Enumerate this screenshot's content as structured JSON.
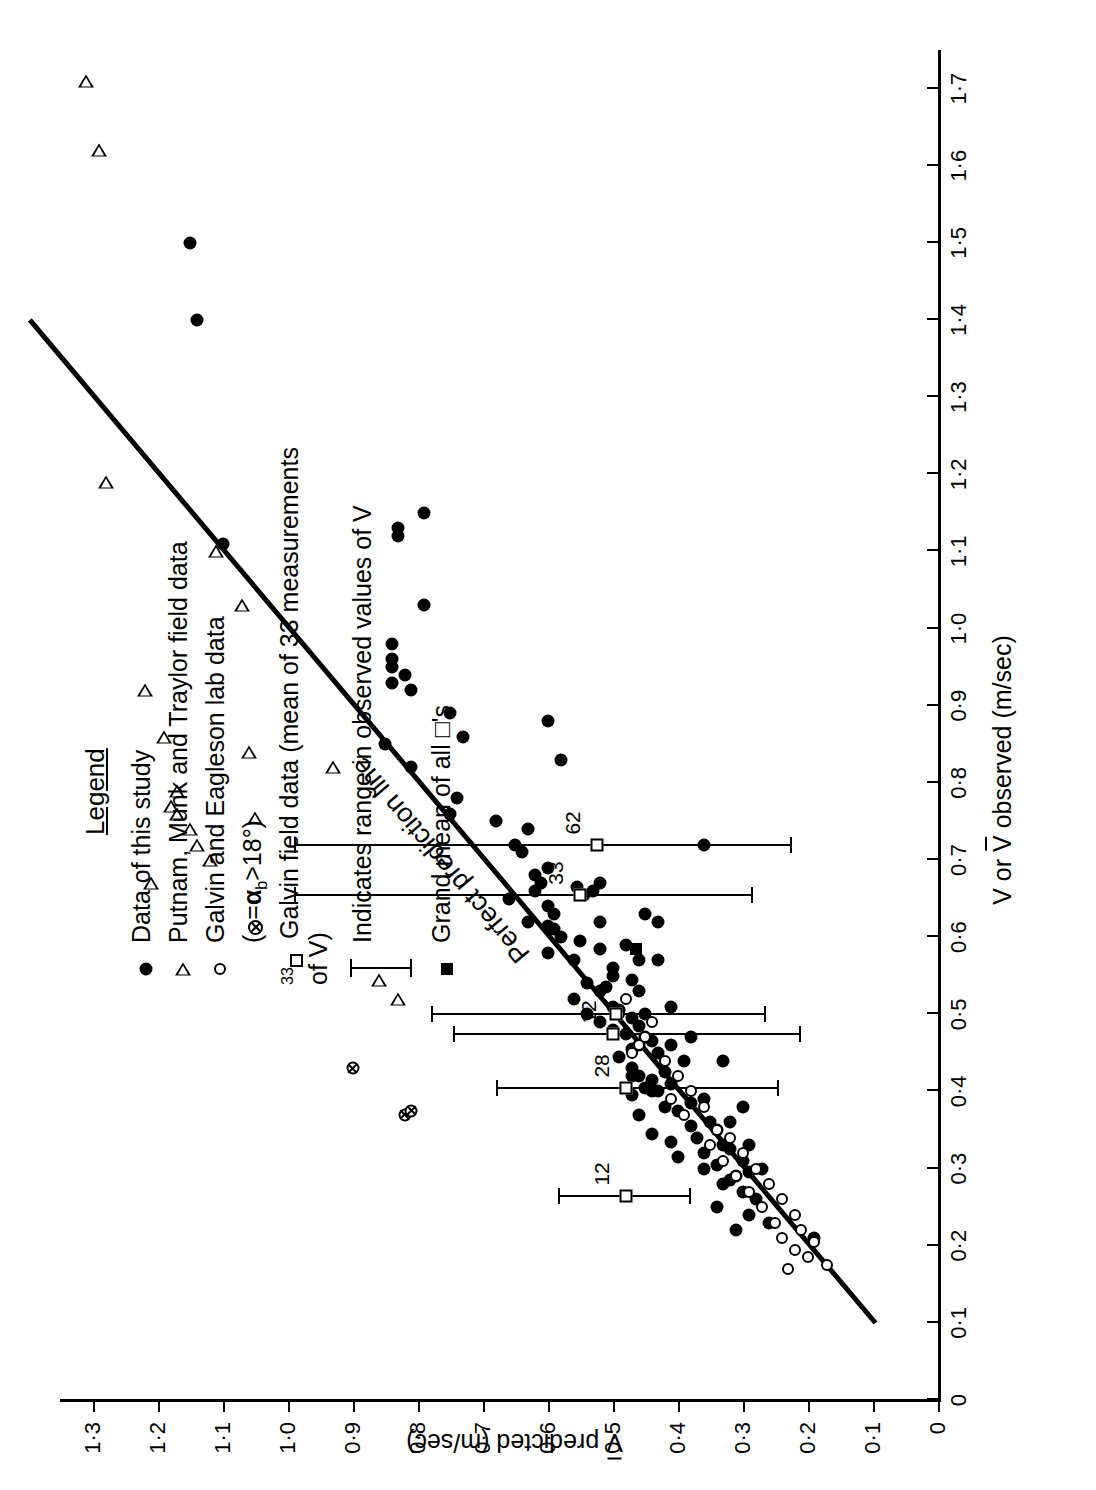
{
  "chart_data": {
    "type": "scatter",
    "title": "",
    "xlabel": "V or V̅ observed (m/sec)",
    "ylabel": "V̅ predicted (m/sec)",
    "xlim": [
      0,
      1.75
    ],
    "ylim": [
      0,
      1.35
    ],
    "xticks": [
      "0",
      "0·1",
      "0·2",
      "0·3",
      "0·4",
      "0·5",
      "0·6",
      "0·7",
      "0·8",
      "0·9",
      "1·0",
      "1·1",
      "1·2",
      "1·3",
      "1·4",
      "1·5",
      "1·6",
      "1·7"
    ],
    "xtickvalues": [
      0,
      0.1,
      0.2,
      0.3,
      0.4,
      0.5,
      0.6,
      0.7,
      0.8,
      0.9,
      1.0,
      1.1,
      1.2,
      1.3,
      1.4,
      1.5,
      1.6,
      1.7
    ],
    "yticks": [
      "0",
      "0·1",
      "0·2",
      "0·3",
      "0·4",
      "0·5",
      "0·6",
      "0·7",
      "0·8",
      "0·9",
      "1·0",
      "1·1",
      "1·2",
      "1·3"
    ],
    "ytickvalues": [
      0,
      0.1,
      0.2,
      0.3,
      0.4,
      0.5,
      0.6,
      0.7,
      0.8,
      0.9,
      1.0,
      1.1,
      1.2,
      1.3
    ],
    "grid": false,
    "legend_position": "top-right",
    "reference_line": {
      "label": "Perfect prediction line",
      "from": [
        0.1,
        0.1
      ],
      "to": [
        1.4,
        1.4
      ]
    },
    "series": [
      {
        "name": "Data of this study",
        "marker": "filled-circle",
        "points": [
          [
            1.5,
            1.15
          ],
          [
            1.4,
            1.14
          ],
          [
            1.11,
            1.1
          ],
          [
            1.15,
            0.79
          ],
          [
            1.13,
            0.83
          ],
          [
            1.12,
            0.83
          ],
          [
            1.03,
            0.79
          ],
          [
            0.98,
            0.84
          ],
          [
            0.96,
            0.84
          ],
          [
            0.95,
            0.84
          ],
          [
            0.93,
            0.84
          ],
          [
            0.94,
            0.82
          ],
          [
            0.92,
            0.81
          ],
          [
            0.89,
            0.75
          ],
          [
            0.86,
            0.73
          ],
          [
            0.85,
            0.85
          ],
          [
            0.82,
            0.81
          ],
          [
            0.78,
            0.74
          ],
          [
            0.76,
            0.75
          ],
          [
            0.75,
            0.68
          ],
          [
            0.74,
            0.63
          ],
          [
            0.72,
            0.65
          ],
          [
            0.71,
            0.64
          ],
          [
            0.69,
            0.6
          ],
          [
            0.68,
            0.62
          ],
          [
            0.67,
            0.61
          ],
          [
            0.66,
            0.62
          ],
          [
            0.665,
            0.555
          ],
          [
            0.655,
            0.545
          ],
          [
            0.66,
            0.53
          ],
          [
            0.65,
            0.66
          ],
          [
            0.64,
            0.6
          ],
          [
            0.63,
            0.59
          ],
          [
            0.62,
            0.63
          ],
          [
            0.615,
            0.6
          ],
          [
            0.61,
            0.59
          ],
          [
            0.6,
            0.58
          ],
          [
            0.595,
            0.55
          ],
          [
            0.585,
            0.52
          ],
          [
            0.58,
            0.6
          ],
          [
            0.57,
            0.56
          ],
          [
            0.56,
            0.5
          ],
          [
            0.55,
            0.5
          ],
          [
            0.545,
            0.47
          ],
          [
            0.54,
            0.54
          ],
          [
            0.535,
            0.51
          ],
          [
            0.53,
            0.52
          ],
          [
            0.52,
            0.56
          ],
          [
            0.51,
            0.5
          ],
          [
            0.505,
            0.49
          ],
          [
            0.5,
            0.45
          ],
          [
            0.495,
            0.47
          ],
          [
            0.49,
            0.52
          ],
          [
            0.485,
            0.46
          ],
          [
            0.48,
            0.5
          ],
          [
            0.475,
            0.48
          ],
          [
            0.47,
            0.45
          ],
          [
            0.465,
            0.44
          ],
          [
            0.46,
            0.46
          ],
          [
            0.455,
            0.47
          ],
          [
            0.45,
            0.43
          ],
          [
            0.445,
            0.49
          ],
          [
            0.44,
            0.39
          ],
          [
            0.43,
            0.47
          ],
          [
            0.425,
            0.42
          ],
          [
            0.42,
            0.46
          ],
          [
            0.415,
            0.44
          ],
          [
            0.41,
            0.41
          ],
          [
            0.405,
            0.45
          ],
          [
            0.4,
            0.43
          ],
          [
            0.395,
            0.47
          ],
          [
            0.39,
            0.36
          ],
          [
            0.385,
            0.38
          ],
          [
            0.38,
            0.42
          ],
          [
            0.375,
            0.4
          ],
          [
            0.37,
            0.46
          ],
          [
            0.36,
            0.35
          ],
          [
            0.355,
            0.38
          ],
          [
            0.35,
            0.34
          ],
          [
            0.345,
            0.44
          ],
          [
            0.34,
            0.37
          ],
          [
            0.335,
            0.41
          ],
          [
            0.33,
            0.33
          ],
          [
            0.325,
            0.32
          ],
          [
            0.32,
            0.36
          ],
          [
            0.315,
            0.4
          ],
          [
            0.31,
            0.3
          ],
          [
            0.305,
            0.34
          ],
          [
            0.3,
            0.36
          ],
          [
            0.295,
            0.29
          ],
          [
            0.29,
            0.31
          ],
          [
            0.285,
            0.32
          ],
          [
            0.28,
            0.33
          ],
          [
            0.27,
            0.3
          ],
          [
            0.26,
            0.28
          ],
          [
            0.25,
            0.34
          ],
          [
            0.24,
            0.29
          ],
          [
            0.23,
            0.26
          ],
          [
            0.22,
            0.31
          ],
          [
            0.21,
            0.19
          ],
          [
            0.72,
            0.36
          ],
          [
            0.42,
            0.47
          ],
          [
            0.4,
            0.44
          ],
          [
            0.62,
            0.52
          ],
          [
            0.59,
            0.48
          ],
          [
            0.5,
            0.54
          ],
          [
            0.57,
            0.46
          ],
          [
            0.46,
            0.41
          ],
          [
            0.53,
            0.46
          ],
          [
            0.67,
            0.52
          ],
          [
            0.63,
            0.45
          ],
          [
            0.47,
            0.38
          ],
          [
            0.44,
            0.33
          ],
          [
            0.36,
            0.32
          ],
          [
            0.38,
            0.3
          ],
          [
            0.33,
            0.29
          ],
          [
            0.3,
            0.27
          ],
          [
            0.62,
            0.43
          ],
          [
            0.57,
            0.43
          ],
          [
            0.51,
            0.41
          ],
          [
            0.88,
            0.6
          ],
          [
            0.83,
            0.58
          ]
        ]
      },
      {
        "name": "Putnam, Munk and Traylor field data",
        "marker": "open-triangle",
        "points": [
          [
            1.71,
            1.31
          ],
          [
            1.62,
            1.29
          ],
          [
            1.19,
            1.28
          ],
          [
            1.1,
            1.11
          ],
          [
            1.03,
            1.07
          ],
          [
            0.92,
            1.22
          ],
          [
            0.86,
            1.19
          ],
          [
            0.84,
            1.06
          ],
          [
            0.79,
            1.17
          ],
          [
            0.77,
            1.18
          ],
          [
            0.76,
            1.17
          ],
          [
            0.74,
            1.15
          ],
          [
            0.72,
            1.14
          ],
          [
            0.7,
            1.12
          ],
          [
            0.67,
            1.21
          ],
          [
            0.545,
            0.86
          ],
          [
            0.52,
            0.83
          ],
          [
            0.82,
            0.93
          ],
          [
            0.755,
            1.05
          ]
        ]
      },
      {
        "name": "Galvin and Eagleson lab data (⊗ = α_b > 18°)",
        "marker": "open-circle",
        "points": [
          [
            0.46,
            0.46
          ],
          [
            0.47,
            0.45
          ],
          [
            0.49,
            0.44
          ],
          [
            0.45,
            0.47
          ],
          [
            0.44,
            0.42
          ],
          [
            0.42,
            0.4
          ],
          [
            0.4,
            0.38
          ],
          [
            0.39,
            0.41
          ],
          [
            0.38,
            0.36
          ],
          [
            0.37,
            0.39
          ],
          [
            0.35,
            0.34
          ],
          [
            0.34,
            0.32
          ],
          [
            0.33,
            0.35
          ],
          [
            0.32,
            0.3
          ],
          [
            0.31,
            0.33
          ],
          [
            0.3,
            0.28
          ],
          [
            0.29,
            0.31
          ],
          [
            0.28,
            0.26
          ],
          [
            0.27,
            0.29
          ],
          [
            0.26,
            0.24
          ],
          [
            0.25,
            0.27
          ],
          [
            0.24,
            0.22
          ],
          [
            0.23,
            0.25
          ],
          [
            0.22,
            0.21
          ],
          [
            0.21,
            0.24
          ],
          [
            0.205,
            0.19
          ],
          [
            0.195,
            0.22
          ],
          [
            0.185,
            0.2
          ],
          [
            0.175,
            0.17
          ],
          [
            0.17,
            0.23
          ],
          [
            0.52,
            0.48
          ],
          [
            0.5,
            0.49
          ]
        ]
      },
      {
        "name": "Galvin and Eagleson lab data, α_b > 18°",
        "marker": "crossed-circle",
        "points": [
          [
            0.43,
            0.9
          ],
          [
            0.37,
            0.82
          ],
          [
            0.375,
            0.81
          ]
        ]
      },
      {
        "name": "Galvin field data (mean of 33 measurements of V)",
        "marker": "open-square",
        "points": [
          [
            0.655,
            0.55
          ],
          [
            0.72,
            0.525
          ],
          [
            0.5,
            0.495
          ],
          [
            0.475,
            0.5
          ],
          [
            0.405,
            0.48
          ],
          [
            0.265,
            0.48
          ]
        ],
        "labels": [
          "33",
          "62",
          "",
          "12",
          "28",
          "12"
        ]
      },
      {
        "name": "Grand mean of all □'s",
        "marker": "filled-square",
        "points": [
          [
            0.585,
            0.465
          ]
        ]
      }
    ],
    "error_bars": [
      {
        "x": 0.655,
        "label": "33",
        "low": 0.285,
        "high": 0.99,
        "center": 0.55
      },
      {
        "x": 0.72,
        "label": "62",
        "low": 0.225,
        "high": 0.99,
        "center": 0.525
      },
      {
        "x": 0.5,
        "label": "",
        "low": 0.265,
        "high": 0.78,
        "center": 0.495
      },
      {
        "x": 0.475,
        "label": "12",
        "low": 0.21,
        "high": 0.745,
        "center": 0.5
      },
      {
        "x": 0.405,
        "label": "28",
        "low": 0.245,
        "high": 0.68,
        "center": 0.48
      },
      {
        "x": 0.265,
        "label": "12",
        "low": 0.38,
        "high": 0.585,
        "center": 0.48
      }
    ],
    "annotations": [
      {
        "text": "Perfect prediction line",
        "along": "reference-line"
      }
    ]
  },
  "legend": {
    "title": "Legend",
    "entries": [
      {
        "symbol": "filled-circle",
        "text": "Data of this study"
      },
      {
        "symbol": "open-triangle",
        "text": "Putnam, Munk and Traylor field data"
      },
      {
        "symbol": "open-circle",
        "text": "Galvin and Eagleson lab data"
      },
      {
        "symbol": "crossed-circle-note",
        "text": "(⊗ = αb>18°)"
      },
      {
        "symbol": "open-square-33",
        "text": "Galvin field data (mean of 33 measurements of V)"
      },
      {
        "symbol": "range-bar",
        "text": "Indicates range in observed values of V"
      },
      {
        "symbol": "filled-square",
        "text": "Grand mean of all  □'s"
      }
    ],
    "superscript_33": "33",
    "alpha_symbol": "α",
    "alpha_sub": "b",
    "angle_text": ">18°",
    "crossed_circle": "⊗",
    "equals": "="
  },
  "axes": {
    "x_title_pre": "V or ",
    "x_title_v": "V",
    "x_title_post": " observed (m/sec)",
    "y_title_v": "V",
    "y_title_post": " predicted (m/sec)"
  }
}
